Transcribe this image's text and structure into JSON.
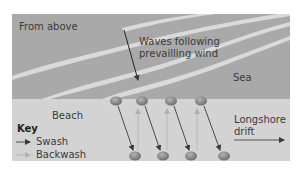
{
  "diagram": {
    "view_label": "From above",
    "waves_label_line1": "Waves following",
    "waves_label_line2": "prevailling wind",
    "sea_label": "Sea",
    "beach_label": "Beach",
    "drift_label_line1": "Longshore",
    "drift_label_line2": "drift",
    "key": {
      "title": "Key",
      "items": [
        {
          "label": "Swash",
          "color": "#4a4a4a"
        },
        {
          "label": "Backwash",
          "color": "#b8b8b8"
        }
      ]
    },
    "colors": {
      "sea": "#a9a9a9",
      "beach": "#d3d3d3",
      "wave": "#d9d9d9",
      "pebble": "#8a8a8a",
      "swash": "#4a4a4a",
      "backwash": "#b8b8b8"
    }
  }
}
